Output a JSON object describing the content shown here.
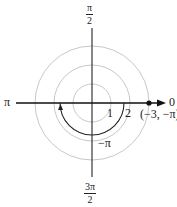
{
  "diagram": {
    "type": "polar-coordinate-plot",
    "center": {
      "x": 92,
      "y": 103
    },
    "circle_radii_px": [
      19,
      38,
      57
    ],
    "colors": {
      "axis": "#111111",
      "grid_circle": "#c8c8c8",
      "arc": "#222222",
      "point": "#111111"
    },
    "angle_labels": {
      "top_num": "π",
      "top_den": "2",
      "left": "π",
      "right": "0",
      "bottom_num": "3π",
      "bottom_den": "2"
    },
    "radius_labels": [
      "1",
      "2"
    ],
    "arc_label": "−π",
    "point": {
      "label": "(−3, −π)",
      "r": -3,
      "theta": "−π"
    }
  }
}
